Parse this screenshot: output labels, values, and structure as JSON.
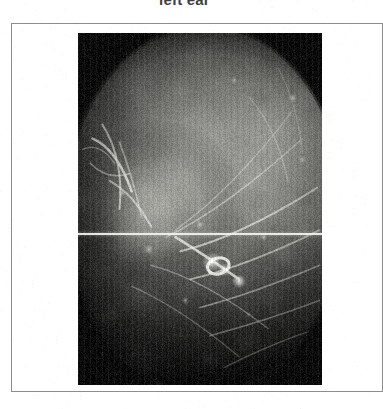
{
  "figure": {
    "title": "left ear",
    "frame": {
      "border_color": "#8d8d8d",
      "background_color": "#ffffff"
    },
    "photo": {
      "alt": "otoscopic-view-of-left-ear-canal",
      "modality": "otoscopy",
      "color_mode": "grayscale",
      "vignette": "circular-dark-corners",
      "background_color": "#0a0a0a",
      "artifacts": [
        "horizontal-scan-line",
        "scan-noise"
      ],
      "scanline": {
        "color": "#f2f2ee",
        "position_y": 200
      },
      "features": [
        "tympanic-membrane-bulge",
        "bright-hair-fibers",
        "specular-highlights",
        "canal-wall-tissue"
      ]
    }
  }
}
